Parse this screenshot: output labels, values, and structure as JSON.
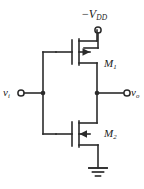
{
  "figure": {
    "type": "circuit-schematic",
    "line_color": "#2b2b2b",
    "background_color": "#ffffff",
    "text_color": "#1a1a1a"
  },
  "labels": {
    "supply": {
      "sign": "−",
      "symbol": "V",
      "subscript": "DD"
    },
    "transistor_top": {
      "symbol": "M",
      "subscript": "1"
    },
    "transistor_bottom": {
      "symbol": "M",
      "subscript": "2"
    },
    "input": {
      "symbol": "v",
      "subscript": "i"
    },
    "output": {
      "symbol": "v",
      "subscript": "o"
    }
  },
  "nodes": {
    "supply_terminal": "supply-terminal-circle",
    "input_terminal": "input-terminal-circle",
    "output_terminal": "output-terminal-circle",
    "gate_junction": "gate-junction-dot",
    "output_junction": "output-junction-dot",
    "ground": "ground-symbol"
  }
}
